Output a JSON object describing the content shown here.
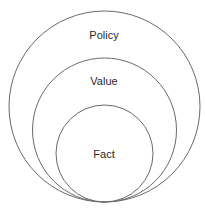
{
  "diagram": {
    "type": "nested-circles",
    "circles": [
      {
        "label": "Policy",
        "cx": 104.5,
        "cy": 106.5,
        "r": 95.5,
        "label_x": 104,
        "label_y": 39
      },
      {
        "label": "Value",
        "cx": 104.5,
        "cy": 130,
        "r": 72,
        "label_x": 104,
        "label_y": 85
      },
      {
        "label": "Fact",
        "cx": 104.5,
        "cy": 153.5,
        "r": 48.5,
        "label_x": 104,
        "label_y": 158
      }
    ],
    "stroke_color": "#6a6a6a",
    "text_color": "#2a2a2a",
    "background": "#ffffff"
  }
}
